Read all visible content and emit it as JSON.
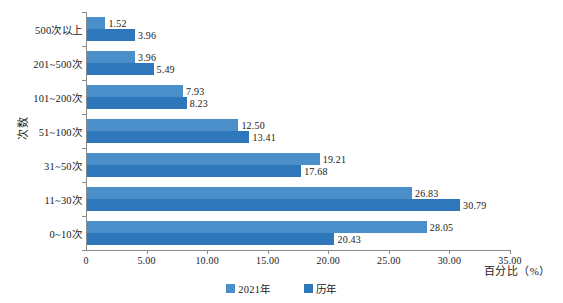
{
  "chart_data": {
    "type": "bar",
    "orientation": "horizontal",
    "title": "",
    "xlabel": "百分比（%）",
    "ylabel": "次数",
    "categories": [
      "0~10次",
      "11~30次",
      "31~50次",
      "51~100次",
      "101~200次",
      "201~500次",
      "500次以上"
    ],
    "series": [
      {
        "name": "2021年",
        "color": "#4a8fc9",
        "values": [
          28.05,
          26.83,
          19.21,
          12.5,
          7.93,
          3.96,
          1.52
        ]
      },
      {
        "name": "历年",
        "color": "#2e77bb",
        "values": [
          20.43,
          30.79,
          17.68,
          13.41,
          8.23,
          5.49,
          3.96
        ]
      }
    ],
    "value_labels": {
      "0~10次": [
        "28.05",
        "20.43"
      ],
      "11~30次": [
        "26.83",
        "30.79"
      ],
      "31~50次": [
        "19.21",
        "17.68"
      ],
      "51~100次": [
        "12.50",
        "13.41"
      ],
      "101~200次": [
        "7.93",
        "8.23"
      ],
      "201~500次": [
        "3.96",
        "5.49"
      ],
      "500次以上": [
        "1.52",
        "3.96"
      ]
    },
    "xlim": [
      0,
      35
    ],
    "xticks": [
      0,
      5,
      10,
      15,
      20,
      25,
      30,
      35
    ],
    "xtick_labels": [
      "0",
      "5.00",
      "10.00",
      "15.00",
      "20.00",
      "25.00",
      "30.00",
      "35.00"
    ],
    "grid": false,
    "legend_position": "bottom-center",
    "legend": [
      "2021年",
      "历年"
    ]
  }
}
